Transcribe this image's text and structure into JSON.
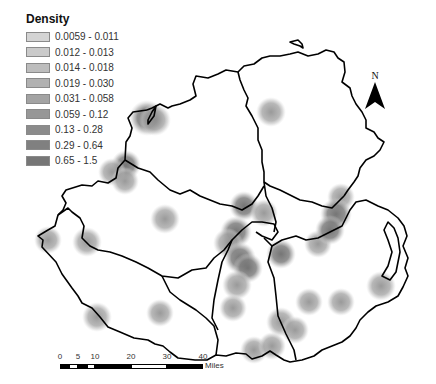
{
  "legend": {
    "title": "Density",
    "classes": [
      {
        "label": "0.0059 - 0.011",
        "color": "#d4d4d4"
      },
      {
        "label": "0.012 - 0.013",
        "color": "#cacaca"
      },
      {
        "label": "0.014 - 0.018",
        "color": "#bdbdbd"
      },
      {
        "label": "0.019 - 0.030",
        "color": "#b1b1b1"
      },
      {
        "label": "0.031 - 0.058",
        "color": "#a3a3a3"
      },
      {
        "label": "0.059 - 0.12",
        "color": "#979797"
      },
      {
        "label": "0.13 - 0.28",
        "color": "#8b8b8b"
      },
      {
        "label": "0.29 - 0.64",
        "color": "#808080"
      },
      {
        "label": "0.65 - 1.5",
        "color": "#767676"
      }
    ]
  },
  "north_arrow": {
    "label": "N"
  },
  "scale_bar": {
    "ticks": [
      "0",
      "5",
      "10",
      "20",
      "30",
      "40"
    ],
    "unit": "Miles"
  },
  "hotspots": [
    {
      "x": 147,
      "y": 118,
      "r": 14,
      "level": 8
    },
    {
      "x": 155,
      "y": 120,
      "r": 12,
      "level": 6
    },
    {
      "x": 271,
      "y": 112,
      "r": 11,
      "level": 6
    },
    {
      "x": 126,
      "y": 165,
      "r": 11,
      "level": 7
    },
    {
      "x": 112,
      "y": 172,
      "r": 10,
      "level": 5
    },
    {
      "x": 125,
      "y": 181,
      "r": 10,
      "level": 5
    },
    {
      "x": 165,
      "y": 219,
      "r": 11,
      "level": 6
    },
    {
      "x": 48,
      "y": 240,
      "r": 10,
      "level": 5
    },
    {
      "x": 87,
      "y": 242,
      "r": 11,
      "level": 5
    },
    {
      "x": 244,
      "y": 206,
      "r": 11,
      "level": 7
    },
    {
      "x": 264,
      "y": 213,
      "r": 10,
      "level": 5
    },
    {
      "x": 236,
      "y": 232,
      "r": 12,
      "level": 8
    },
    {
      "x": 228,
      "y": 243,
      "r": 11,
      "level": 6
    },
    {
      "x": 240,
      "y": 258,
      "r": 12,
      "level": 7
    },
    {
      "x": 248,
      "y": 268,
      "r": 11,
      "level": 8
    },
    {
      "x": 237,
      "y": 285,
      "r": 11,
      "level": 6
    },
    {
      "x": 233,
      "y": 308,
      "r": 10,
      "level": 5
    },
    {
      "x": 281,
      "y": 254,
      "r": 11,
      "level": 7
    },
    {
      "x": 318,
      "y": 244,
      "r": 10,
      "level": 5
    },
    {
      "x": 341,
      "y": 197,
      "r": 10,
      "level": 5
    },
    {
      "x": 336,
      "y": 214,
      "r": 12,
      "level": 8
    },
    {
      "x": 330,
      "y": 230,
      "r": 11,
      "level": 7
    },
    {
      "x": 97,
      "y": 317,
      "r": 11,
      "level": 6
    },
    {
      "x": 160,
      "y": 313,
      "r": 10,
      "level": 5
    },
    {
      "x": 281,
      "y": 322,
      "r": 11,
      "level": 6
    },
    {
      "x": 295,
      "y": 330,
      "r": 10,
      "level": 5
    },
    {
      "x": 309,
      "y": 302,
      "r": 10,
      "level": 5
    },
    {
      "x": 341,
      "y": 302,
      "r": 10,
      "level": 5
    },
    {
      "x": 381,
      "y": 286,
      "r": 11,
      "level": 5
    },
    {
      "x": 254,
      "y": 350,
      "r": 10,
      "level": 5
    },
    {
      "x": 272,
      "y": 346,
      "r": 10,
      "level": 5
    }
  ]
}
